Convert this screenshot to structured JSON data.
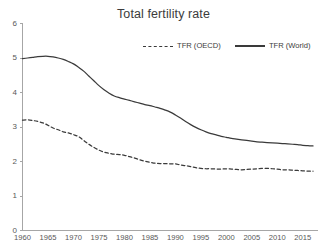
{
  "chart_data": {
    "type": "line",
    "title": "Total fertility rate",
    "xlabel": "",
    "ylabel": "",
    "xlim": [
      1960,
      2017
    ],
    "ylim": [
      0,
      6
    ],
    "grid": false,
    "legend_position": "top-right",
    "x_ticks": [
      "1960",
      "1965",
      "1970",
      "1975",
      "1980",
      "1985",
      "1990",
      "1995",
      "2000",
      "2005",
      "2010",
      "2015"
    ],
    "y_ticks": [
      "0",
      "1",
      "2",
      "3",
      "4",
      "5",
      "6"
    ],
    "x": [
      1960,
      1961,
      1962,
      1963,
      1964,
      1965,
      1966,
      1967,
      1968,
      1969,
      1970,
      1971,
      1972,
      1973,
      1974,
      1975,
      1976,
      1977,
      1978,
      1979,
      1980,
      1981,
      1982,
      1983,
      1984,
      1985,
      1986,
      1987,
      1988,
      1989,
      1990,
      1991,
      1992,
      1993,
      1994,
      1995,
      1996,
      1997,
      1998,
      1999,
      2000,
      2001,
      2002,
      2003,
      2004,
      2005,
      2006,
      2007,
      2008,
      2009,
      2010,
      2011,
      2012,
      2013,
      2014,
      2015,
      2016,
      2017
    ],
    "series": [
      {
        "name": "TFR (OECD)",
        "style": "dashed",
        "color": "#3a3a3a",
        "values": [
          3.2,
          3.21,
          3.19,
          3.16,
          3.12,
          3.05,
          2.97,
          2.92,
          2.86,
          2.83,
          2.78,
          2.72,
          2.61,
          2.5,
          2.41,
          2.33,
          2.27,
          2.24,
          2.21,
          2.2,
          2.18,
          2.14,
          2.1,
          2.05,
          2.01,
          1.98,
          1.95,
          1.94,
          1.94,
          1.93,
          1.93,
          1.9,
          1.88,
          1.85,
          1.82,
          1.8,
          1.79,
          1.79,
          1.78,
          1.78,
          1.79,
          1.78,
          1.77,
          1.76,
          1.77,
          1.78,
          1.79,
          1.8,
          1.8,
          1.79,
          1.78,
          1.76,
          1.76,
          1.75,
          1.74,
          1.73,
          1.72,
          1.72
        ]
      },
      {
        "name": "TFR (World)",
        "style": "solid",
        "color": "#3a3a3a",
        "values": [
          4.98,
          5.0,
          5.02,
          5.04,
          5.05,
          5.05,
          5.03,
          5.0,
          4.96,
          4.9,
          4.83,
          4.73,
          4.62,
          4.48,
          4.34,
          4.2,
          4.08,
          3.98,
          3.9,
          3.85,
          3.81,
          3.77,
          3.73,
          3.69,
          3.65,
          3.62,
          3.58,
          3.54,
          3.49,
          3.43,
          3.35,
          3.26,
          3.16,
          3.07,
          2.99,
          2.92,
          2.86,
          2.81,
          2.77,
          2.73,
          2.7,
          2.67,
          2.65,
          2.63,
          2.61,
          2.59,
          2.57,
          2.56,
          2.55,
          2.54,
          2.53,
          2.52,
          2.51,
          2.5,
          2.49,
          2.47,
          2.46,
          2.45
        ]
      }
    ]
  },
  "legend": {
    "entries": [
      {
        "label": "TFR (OECD)",
        "style": "dashed"
      },
      {
        "label": "TFR (World)",
        "style": "solid"
      }
    ]
  },
  "colors": {
    "series": "#3a3a3a",
    "axis": "#a6a6a6",
    "tick_text": "#585858",
    "title_text": "#3c3c3c",
    "background": "#ffffff"
  }
}
